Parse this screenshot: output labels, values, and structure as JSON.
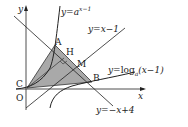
{
  "diagram": {
    "axes": {
      "x_label": "x",
      "y_label": "y",
      "origin_label": "O"
    },
    "points": {
      "A": "A",
      "H": "H",
      "M": "M",
      "B": "B",
      "C": "C"
    },
    "curves": {
      "exp": {
        "prefix": "y=",
        "base": "a",
        "exponent": "x−1"
      },
      "log": {
        "prefix": "y=",
        "func": "log",
        "base": "a",
        "arg": "(x−1)"
      },
      "line1": "y=x−1",
      "line2": "y=−x+4"
    },
    "shaded_region": "triangle CAB",
    "colors": {
      "shade": "#a9a9a9",
      "line": "#222222"
    }
  }
}
